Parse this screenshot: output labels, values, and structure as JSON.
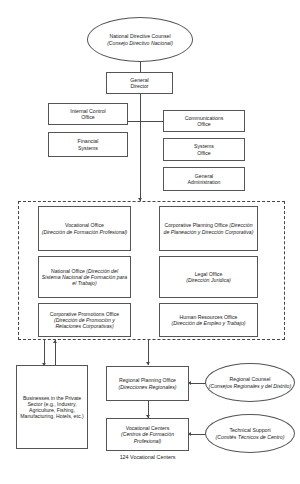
{
  "diagram": {
    "title_caption": "124 Vocational Centers",
    "colors": {
      "stroke": "#555555",
      "connector": "#4a4a4a",
      "dashed_group": "#444444",
      "background": "#ffffff",
      "text": "#1a1a1a"
    }
  },
  "nodes": {
    "national_directive_counsel": {
      "en": "National Directive Counsel",
      "es": "(Consejo Directivo Nacional)",
      "shape": "ellipse"
    },
    "general_director": {
      "en": "General\nDirector",
      "es": "",
      "shape": "box"
    },
    "internal_control_office": {
      "en": "Internal Control\nOffice",
      "es": "",
      "shape": "box"
    },
    "communications_office": {
      "en": "Communications\nOffice",
      "es": "",
      "shape": "box"
    },
    "financial_systems": {
      "en": "Financial\nSystems",
      "es": "",
      "shape": "box"
    },
    "systems_office": {
      "en": "Systems\nOffice",
      "es": "",
      "shape": "box"
    },
    "general_administration": {
      "en": "General\nAdministration",
      "es": "",
      "shape": "box"
    },
    "vocational_office": {
      "en": "Vocational Office",
      "es": "(Dirección de Formación Profesional)",
      "shape": "box"
    },
    "corporative_planning_office": {
      "en": "Corporative Planning Office ",
      "es": "(Dirección de Planeación y Dirección Corporativa)",
      "shape": "box"
    },
    "national_office": {
      "en": "National Office ",
      "es": "(Dirección del Sistema Nacional de Formación para el Trabajo)",
      "shape": "box"
    },
    "legal_office": {
      "en": "Legal Office",
      "es": "(Dirección Jurídica)",
      "shape": "box"
    },
    "corporative_promotions_office": {
      "en": "Corporative Promotions Office ",
      "es": "(Dirección de Promoción y Relaciones Corporativas)",
      "shape": "box"
    },
    "human_resources_office": {
      "en": "Human Resources Office",
      "es": "(Dirección de Empleo y Trabajo)",
      "shape": "box"
    },
    "businesses_private_sector": {
      "en": "Businesses in the Private Sector (e.g., Industry, Agriculture, Fishing, Manufacturing, Hotels, etc.)",
      "es": "",
      "shape": "box"
    },
    "regional_planning_office": {
      "en": "Regional Planning Office ",
      "es": "(Direcciones Regionales)",
      "shape": "box"
    },
    "regional_counsel": {
      "en": "Regional Counsel",
      "es": "(Consejos Regionales y del Distrito)",
      "shape": "ellipse"
    },
    "vocational_centers": {
      "en": "Vocational Centers",
      "es": "(Centros de Formación Profesional)",
      "shape": "box"
    },
    "technical_support": {
      "en": "Technical Support",
      "es": "(Comités Técnicos de Centro)",
      "shape": "ellipse"
    }
  }
}
